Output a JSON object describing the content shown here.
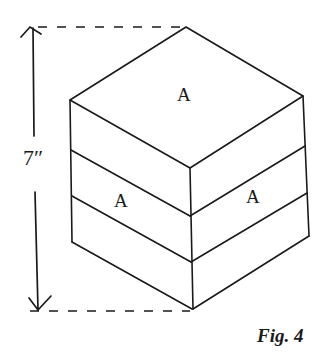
{
  "figure": {
    "caption": "Fig. 4",
    "dimension_label": "7″",
    "face_labels": {
      "top": "A",
      "left": "A",
      "right": "A"
    },
    "layers": 3,
    "colors": {
      "ink": "#1a1a1a",
      "background": "#ffffff"
    }
  }
}
